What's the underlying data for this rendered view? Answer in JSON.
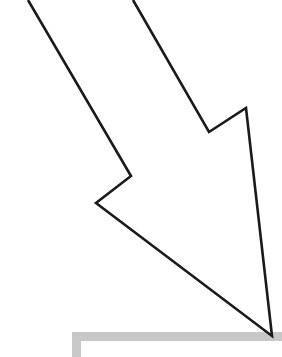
{
  "figure": {
    "width": 282,
    "height": 357,
    "background_color": "#ffffff"
  },
  "arrow": {
    "name": "down-right-arrow",
    "stroke_color": "#1a1a1a",
    "fill_color": "#ffffff",
    "stroke_width": 2.6,
    "direction": "down-right",
    "tip_point": [
      272,
      336
    ],
    "left_barb_tip": [
      96,
      203
    ],
    "right_barb_tip": [
      246,
      108
    ],
    "left_inner_vertex": [
      131,
      176
    ],
    "right_inner_vertex": [
      209,
      132
    ],
    "shaft_left_top": [
      28,
      0
    ],
    "shaft_right_top": [
      133,
      0
    ],
    "outline_path": "M 28 0 L 131 176 L 96 203 L 272 336 L 246 108 L 209 132 L 133 0"
  },
  "box_frame": {
    "name": "box-corner-frame",
    "color": "#c8c8c8",
    "thickness": 9,
    "horizontal_bar": {
      "x": 72,
      "y": 332,
      "width": 210,
      "height": 9
    },
    "vertical_bar": {
      "x": 72,
      "y": 332,
      "width": 9,
      "height": 25
    }
  }
}
